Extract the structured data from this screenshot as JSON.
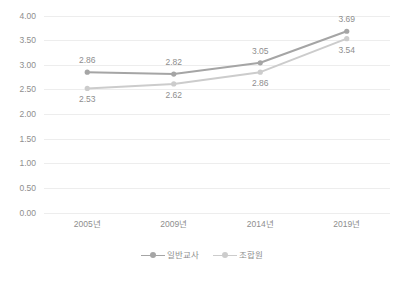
{
  "chart_data": {
    "type": "line",
    "title": "",
    "xlabel": "",
    "ylabel": "",
    "ylim": [
      0,
      4
    ],
    "ytick_step": 0.5,
    "grid": true,
    "legend_position": "bottom",
    "categories": [
      "2005년",
      "2009년",
      "2014년",
      "2019년"
    ],
    "ytick_labels": [
      "4.00",
      "3.50",
      "3.00",
      "2.50",
      "2.00",
      "1.50",
      "1.00",
      "0.50",
      "0.00"
    ],
    "ytick_values": [
      4.0,
      3.5,
      3.0,
      2.5,
      2.0,
      1.5,
      1.0,
      0.5,
      0.0
    ],
    "series": [
      {
        "name": "일반교사",
        "color": "#A5A5A5",
        "values": [
          2.86,
          2.82,
          3.05,
          3.69
        ],
        "labels": [
          "2.86",
          "2.82",
          "3.05",
          "3.69"
        ],
        "label_positions": [
          "above",
          "above",
          "above",
          "above"
        ]
      },
      {
        "name": "조합원",
        "color": "#CCCCCC",
        "values": [
          2.53,
          2.62,
          2.86,
          3.54
        ],
        "labels": [
          "2.53",
          "2.62",
          "2.86",
          "3.54"
        ],
        "label_positions": [
          "below",
          "below",
          "below",
          "below"
        ]
      }
    ]
  },
  "colors": {
    "series_1": "#A5A5A5",
    "series_2": "#CCCCCC",
    "gridline": "#EDEDED",
    "text": "#8E8E8E",
    "background": "#FFFFFF"
  },
  "legend": {
    "items": [
      {
        "label": "일반교사",
        "color": "#A5A5A5"
      },
      {
        "label": "조합원",
        "color": "#CCCCCC"
      }
    ]
  }
}
